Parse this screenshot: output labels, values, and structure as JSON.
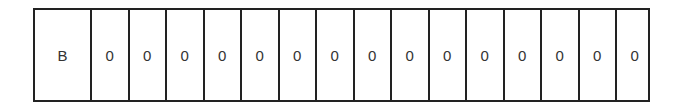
{
  "tape": {
    "cells": [
      "B",
      "0",
      "0",
      "0",
      "0",
      "0",
      "0",
      "0",
      "0",
      "0",
      "0",
      "0",
      "0",
      "0",
      "0",
      "0"
    ]
  }
}
